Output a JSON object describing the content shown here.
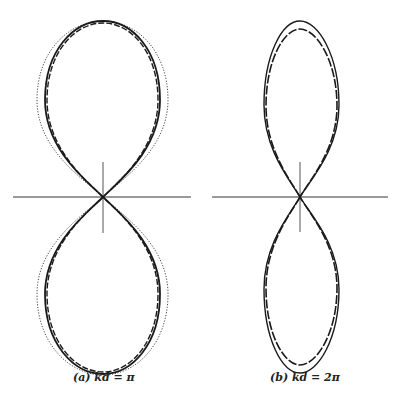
{
  "figure": {
    "panels": [
      {
        "id": "a",
        "caption": "(a) kd = π",
        "kd": "π",
        "center": [
          103,
          197
        ],
        "curves": [
          {
            "name": "solid",
            "style": "solid"
          },
          {
            "name": "dashed",
            "style": "dashed"
          },
          {
            "name": "dotted",
            "style": "dotted"
          }
        ]
      },
      {
        "id": "b",
        "caption": "(b) kd = 2π",
        "kd": "2π",
        "center": [
          300,
          197
        ],
        "curves": [
          {
            "name": "solid",
            "style": "solid"
          },
          {
            "name": "dashed",
            "style": "dashed"
          }
        ]
      }
    ]
  },
  "colors": {
    "line": "#1a1a1a",
    "axis": "#333333",
    "background": "#ffffff"
  }
}
